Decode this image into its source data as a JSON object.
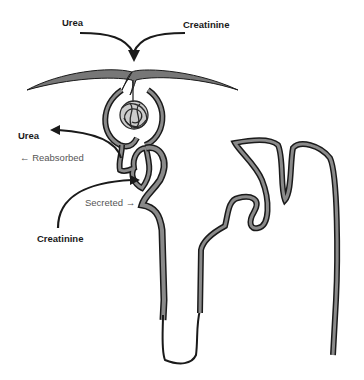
{
  "diagram": {
    "type": "nephron-transport",
    "labels": {
      "urea_top": "Urea",
      "creatinine_top": "Creatinine",
      "urea_left": "Urea",
      "reabsorbed": "← Reabsorbed",
      "secreted": "Secreted →",
      "creatinine_bottom": "Creatinine"
    },
    "colors": {
      "outline": "#1a1a1a",
      "tubule_fill": "#8a8a8a",
      "background": "#ffffff"
    }
  }
}
